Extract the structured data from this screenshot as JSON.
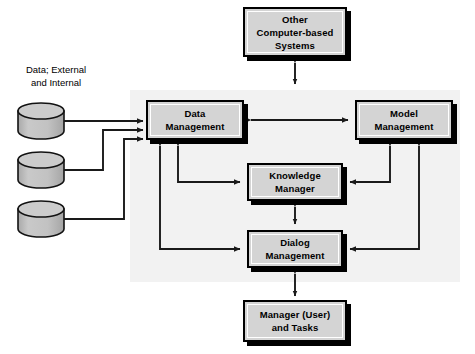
{
  "diagram": {
    "title_visible": false,
    "background_color": "#ffffff",
    "panel": {
      "name": "decision-support-system-panel",
      "fill": "#f2f2f2",
      "x": 130,
      "y": 90,
      "width": 330,
      "height": 192
    },
    "colors": {
      "box_fill": "#d4d4d4",
      "box_border": "#000000",
      "box_shadow": "#000000",
      "cylinder_fill": "#c0c0c0",
      "cylinder_top_fill": "#c8c8c8",
      "arrow": "#1a1a1a",
      "panel": "#f2f2f2",
      "text": "#000000"
    },
    "captions": [
      {
        "name": "data-sources-caption",
        "text": "Data; External\nand Internal",
        "x": 8,
        "y": 64,
        "width": 96
      }
    ],
    "cylinders": [
      {
        "name": "data-store-external-1",
        "x": 18,
        "y": 103,
        "width": 46,
        "height": 36
      },
      {
        "name": "data-store-external-2",
        "x": 18,
        "y": 152,
        "width": 46,
        "height": 36
      },
      {
        "name": "data-store-external-3",
        "x": 18,
        "y": 201,
        "width": 46,
        "height": 36
      }
    ],
    "boxes": [
      {
        "name": "other-computer-based-systems-box",
        "label": "Other\nComputer-based\nSystems",
        "x": 243,
        "y": 7,
        "width": 104,
        "height": 50
      },
      {
        "name": "data-management-box",
        "label": "Data\nManagement",
        "x": 146,
        "y": 100,
        "width": 98,
        "height": 40
      },
      {
        "name": "model-management-box",
        "label": "Model\nManagement",
        "x": 355,
        "y": 100,
        "width": 98,
        "height": 40
      },
      {
        "name": "knowledge-manager-box",
        "label": "Knowledge\nManager",
        "x": 247,
        "y": 163,
        "width": 96,
        "height": 38
      },
      {
        "name": "dialog-management-box",
        "label": "Dialog\nManagement",
        "x": 247,
        "y": 230,
        "width": 96,
        "height": 38
      },
      {
        "name": "manager-user-and-tasks-box",
        "label": "Manager (User)\nand Tasks",
        "x": 243,
        "y": 300,
        "width": 104,
        "height": 42
      }
    ],
    "connections": [
      {
        "name": "arrow-other-systems-to-panel",
        "from": "Other Computer-based Systems",
        "to": "Decision Support System",
        "direction": "bidirectional"
      },
      {
        "name": "arrow-data-store-1-to-data-management",
        "from": "Data store 1",
        "to": "Data Management",
        "direction": "unidirectional"
      },
      {
        "name": "arrow-data-store-2-to-data-management",
        "from": "Data store 2",
        "to": "Data Management",
        "direction": "unidirectional"
      },
      {
        "name": "arrow-data-store-3-to-data-management",
        "from": "Data store 3",
        "to": "Data Management",
        "direction": "unidirectional"
      },
      {
        "name": "arrow-data-management-to-model-management",
        "from": "Data Management",
        "to": "Model Management",
        "direction": "bidirectional"
      },
      {
        "name": "arrow-data-management-to-knowledge-manager",
        "from": "Data Management",
        "to": "Knowledge Manager",
        "direction": "bidirectional"
      },
      {
        "name": "arrow-data-management-to-dialog-management",
        "from": "Data Management",
        "to": "Dialog Management",
        "direction": "bidirectional"
      },
      {
        "name": "arrow-model-management-to-knowledge-manager",
        "from": "Model Management",
        "to": "Knowledge Manager",
        "direction": "bidirectional"
      },
      {
        "name": "arrow-model-management-to-dialog-management",
        "from": "Model Management",
        "to": "Dialog Management",
        "direction": "bidirectional"
      },
      {
        "name": "arrow-knowledge-manager-to-dialog-management",
        "from": "Knowledge Manager",
        "to": "Dialog Management",
        "direction": "bidirectional"
      },
      {
        "name": "arrow-dialog-management-to-manager-user",
        "from": "Dialog Management",
        "to": "Manager (User) and Tasks",
        "direction": "bidirectional"
      }
    ]
  }
}
